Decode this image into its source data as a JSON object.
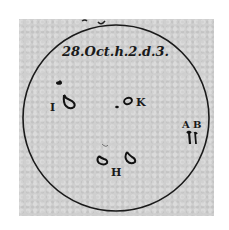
{
  "figure": {
    "type": "sunspot drawing",
    "date_inscription": "28.Oct.h.2.d.3.",
    "colors": {
      "paper": "#cfcfcf",
      "ink": "#1a1a1a",
      "background": "#ffffff"
    },
    "spots": [
      {
        "label": "I",
        "x": 59,
        "y": 103
      },
      {
        "label": "K",
        "x": 143,
        "y": 102
      },
      {
        "label": "H",
        "x": 116,
        "y": 172
      },
      {
        "label": "A",
        "x": 187,
        "y": 125
      },
      {
        "label": "B",
        "x": 199,
        "y": 125
      }
    ]
  }
}
